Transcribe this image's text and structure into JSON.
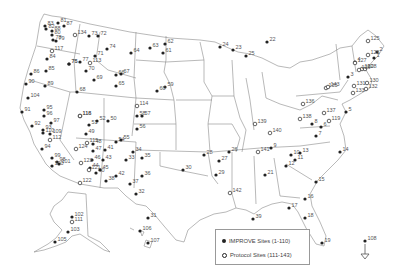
{
  "map": {
    "region": "United States (incl. Alaska, Hawaii, Virgin Islands)",
    "outline_color": "#888888",
    "marker_color": "#222222"
  },
  "legend": {
    "improve_label": "IMPROVE Sites (1-110)",
    "protocol_label": "Protocol Sites (111-143)"
  },
  "sites": {
    "improve": [
      {
        "id": "1",
        "x": 374,
        "y": 58
      },
      {
        "id": "2",
        "x": 377,
        "y": 52
      },
      {
        "id": "3",
        "x": 348,
        "y": 77
      },
      {
        "id": "4",
        "x": 355,
        "y": 62
      },
      {
        "id": "5",
        "x": 346,
        "y": 112
      },
      {
        "id": "6",
        "x": 321,
        "y": 127
      },
      {
        "id": "7",
        "x": 316,
        "y": 136
      },
      {
        "id": "8",
        "x": 312,
        "y": 124
      },
      {
        "id": "9",
        "x": 271,
        "y": 148
      },
      {
        "id": "10",
        "x": 291,
        "y": 155
      },
      {
        "id": "11",
        "x": 295,
        "y": 160
      },
      {
        "id": "12",
        "x": 286,
        "y": 166
      },
      {
        "id": "13",
        "x": 300,
        "y": 153
      },
      {
        "id": "14",
        "x": 340,
        "y": 152
      },
      {
        "id": "15",
        "x": 316,
        "y": 182
      },
      {
        "id": "16",
        "x": 305,
        "y": 199
      },
      {
        "id": "17",
        "x": 289,
        "y": 208
      },
      {
        "id": "18",
        "x": 305,
        "y": 218
      },
      {
        "id": "19",
        "x": 322,
        "y": 243
      },
      {
        "id": "21",
        "x": 265,
        "y": 175
      },
      {
        "id": "22",
        "x": 267,
        "y": 42
      },
      {
        "id": "23",
        "x": 233,
        "y": 50
      },
      {
        "id": "24",
        "x": 220,
        "y": 47
      },
      {
        "id": "25",
        "x": 246,
        "y": 56
      },
      {
        "id": "26",
        "x": 229,
        "y": 152
      },
      {
        "id": "27",
        "x": 219,
        "y": 161
      },
      {
        "id": "28",
        "x": 204,
        "y": 155
      },
      {
        "id": "29",
        "x": 216,
        "y": 175
      },
      {
        "id": "30",
        "x": 183,
        "y": 170
      },
      {
        "id": "31",
        "x": 148,
        "y": 218
      },
      {
        "id": "32",
        "x": 136,
        "y": 194
      },
      {
        "id": "33",
        "x": 126,
        "y": 160
      },
      {
        "id": "34",
        "x": 133,
        "y": 152
      },
      {
        "id": "35",
        "x": 142,
        "y": 158
      },
      {
        "id": "36",
        "x": 142,
        "y": 176
      },
      {
        "id": "37",
        "x": 130,
        "y": 184
      },
      {
        "id": "38",
        "x": 106,
        "y": 181
      },
      {
        "id": "39",
        "x": 253,
        "y": 219
      },
      {
        "id": "40",
        "x": 96,
        "y": 173
      },
      {
        "id": "41",
        "x": 105,
        "y": 150
      },
      {
        "id": "42",
        "x": 116,
        "y": 176
      },
      {
        "id": "43",
        "x": 103,
        "y": 160
      },
      {
        "id": "44",
        "x": 90,
        "y": 168
      },
      {
        "id": "45",
        "x": 100,
        "y": 170
      },
      {
        "id": "46",
        "x": 92,
        "y": 160
      },
      {
        "id": "47",
        "x": 93,
        "y": 151
      },
      {
        "id": "48",
        "x": 93,
        "y": 144
      },
      {
        "id": "49",
        "x": 86,
        "y": 134
      },
      {
        "id": "50",
        "x": 108,
        "y": 121
      },
      {
        "id": "51",
        "x": 89,
        "y": 125
      },
      {
        "id": "52",
        "x": 97,
        "y": 121
      },
      {
        "id": "54",
        "x": 116,
        "y": 142
      },
      {
        "id": "55",
        "x": 121,
        "y": 140
      },
      {
        "id": "56",
        "x": 137,
        "y": 129
      },
      {
        "id": "57",
        "x": 142,
        "y": 116
      },
      {
        "id": "58",
        "x": 137,
        "y": 116
      },
      {
        "id": "59",
        "x": 165,
        "y": 87
      },
      {
        "id": "60",
        "x": 157,
        "y": 91
      },
      {
        "id": "61",
        "x": 163,
        "y": 53
      },
      {
        "id": "62",
        "x": 165,
        "y": 44
      },
      {
        "id": "63",
        "x": 150,
        "y": 48
      },
      {
        "id": "64",
        "x": 131,
        "y": 53
      },
      {
        "id": "65",
        "x": 116,
        "y": 86
      },
      {
        "id": "66",
        "x": 116,
        "y": 75
      },
      {
        "id": "67",
        "x": 121,
        "y": 74
      },
      {
        "id": "68",
        "x": 77,
        "y": 92
      },
      {
        "id": "69",
        "x": 94,
        "y": 80
      },
      {
        "id": "70",
        "x": 86,
        "y": 71
      },
      {
        "id": "71",
        "x": 95,
        "y": 56
      },
      {
        "id": "72",
        "x": 98,
        "y": 36
      },
      {
        "id": "73",
        "x": 89,
        "y": 36
      },
      {
        "id": "74",
        "x": 107,
        "y": 49
      },
      {
        "id": "75",
        "x": 69,
        "y": 64
      },
      {
        "id": "76",
        "x": 69,
        "y": 64
      },
      {
        "id": "77",
        "x": 80,
        "y": 62
      },
      {
        "id": "78",
        "x": 53,
        "y": 40
      },
      {
        "id": "79",
        "x": 56,
        "y": 41
      },
      {
        "id": "80",
        "x": 52,
        "y": 35
      },
      {
        "id": "81",
        "x": 58,
        "y": 23
      },
      {
        "id": "82",
        "x": 46,
        "y": 29
      },
      {
        "id": "83",
        "x": 45,
        "y": 26
      },
      {
        "id": "84",
        "x": 47,
        "y": 59
      },
      {
        "id": "85",
        "x": 46,
        "y": 71
      },
      {
        "id": "86",
        "x": 31,
        "y": 74
      },
      {
        "id": "87",
        "x": 64,
        "y": 26
      },
      {
        "id": "88",
        "x": 52,
        "y": 31
      },
      {
        "id": "89",
        "x": 45,
        "y": 86
      },
      {
        "id": "90",
        "x": 26,
        "y": 84
      },
      {
        "id": "91",
        "x": 22,
        "y": 112
      },
      {
        "id": "92",
        "x": 32,
        "y": 126
      },
      {
        "id": "93",
        "x": 43,
        "y": 130
      },
      {
        "id": "94",
        "x": 42,
        "y": 149
      },
      {
        "id": "95",
        "x": 44,
        "y": 110
      },
      {
        "id": "96",
        "x": 44,
        "y": 116
      },
      {
        "id": "97",
        "x": 51,
        "y": 123
      },
      {
        "id": "98",
        "x": 57,
        "y": 162
      },
      {
        "id": "99",
        "x": 52,
        "y": 158
      },
      {
        "id": "100",
        "x": 52,
        "y": 166
      },
      {
        "id": "101",
        "x": 59,
        "y": 164
      },
      {
        "id": "102",
        "x": 72,
        "y": 217
      },
      {
        "id": "103",
        "x": 68,
        "y": 232
      },
      {
        "id": "104",
        "x": 28,
        "y": 98
      },
      {
        "id": "105",
        "x": 55,
        "y": 242
      },
      {
        "id": "106",
        "x": 140,
        "y": 231
      },
      {
        "id": "107",
        "x": 148,
        "y": 243
      },
      {
        "id": "108",
        "x": 365,
        "y": 241
      },
      {
        "id": "109",
        "x": 50,
        "y": 134
      },
      {
        "id": "110",
        "x": 43,
        "y": 133
      }
    ],
    "protocol": [
      {
        "id": "111",
        "x": 72,
        "y": 222
      },
      {
        "id": "112",
        "x": 50,
        "y": 140
      },
      {
        "id": "113",
        "x": 90,
        "y": 63
      },
      {
        "id": "114",
        "x": 137,
        "y": 106
      },
      {
        "id": "115",
        "x": 87,
        "y": 143
      },
      {
        "id": "116",
        "x": 80,
        "y": 116
      },
      {
        "id": "117",
        "x": 52,
        "y": 51
      },
      {
        "id": "118",
        "x": 80,
        "y": 116
      },
      {
        "id": "119",
        "x": 329,
        "y": 121
      },
      {
        "id": "120",
        "x": 362,
        "y": 69
      },
      {
        "id": "121",
        "x": 89,
        "y": 170
      },
      {
        "id": "122",
        "x": 80,
        "y": 183
      },
      {
        "id": "123",
        "x": 81,
        "y": 163
      },
      {
        "id": "124",
        "x": 76,
        "y": 149
      },
      {
        "id": "125",
        "x": 368,
        "y": 41
      },
      {
        "id": "126",
        "x": 368,
        "y": 55
      },
      {
        "id": "127",
        "x": 355,
        "y": 63
      },
      {
        "id": "128",
        "x": 365,
        "y": 69
      },
      {
        "id": "129",
        "x": 359,
        "y": 70
      },
      {
        "id": "130",
        "x": 367,
        "y": 83
      },
      {
        "id": "131",
        "x": 354,
        "y": 86
      },
      {
        "id": "132",
        "x": 366,
        "y": 89
      },
      {
        "id": "133",
        "x": 353,
        "y": 93
      },
      {
        "id": "134",
        "x": 75,
        "y": 35
      },
      {
        "id": "135",
        "x": 326,
        "y": 88
      },
      {
        "id": "136",
        "x": 303,
        "y": 104
      },
      {
        "id": "137",
        "x": 324,
        "y": 113
      },
      {
        "id": "138",
        "x": 300,
        "y": 119
      },
      {
        "id": "139",
        "x": 255,
        "y": 124
      },
      {
        "id": "140",
        "x": 270,
        "y": 133
      },
      {
        "id": "141",
        "x": 258,
        "y": 152
      },
      {
        "id": "142",
        "x": 230,
        "y": 193
      },
      {
        "id": "143",
        "x": 328,
        "y": 87
      }
    ]
  }
}
